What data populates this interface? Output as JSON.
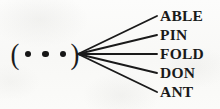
{
  "diagram": {
    "type": "fan",
    "ink_color": "#1a1a1a",
    "background_color": "#fbfbfa",
    "source_node": {
      "open_paren": "(",
      "close_paren": ")",
      "dot_glyph": "•",
      "dot_count": 3,
      "reading": "( • • • )"
    },
    "branches": [
      {
        "label": "ABLE",
        "y": 16
      },
      {
        "label": "PIN",
        "y": 35
      },
      {
        "label": "FOLD",
        "y": 54
      },
      {
        "label": "DON",
        "y": 73
      },
      {
        "label": "ANT",
        "y": 92
      }
    ],
    "apex": {
      "x": 78,
      "y": 54
    },
    "branch_end_x": 157
  }
}
